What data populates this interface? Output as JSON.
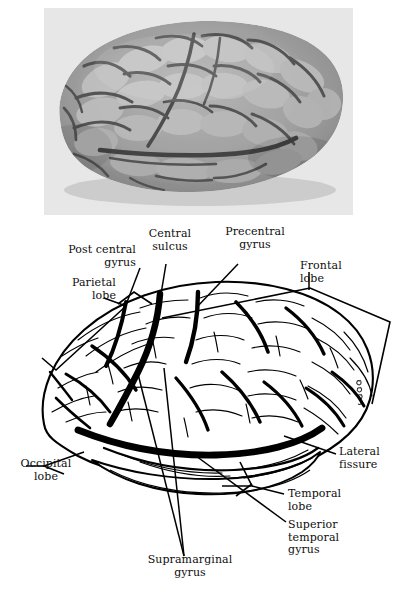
{
  "figure": {
    "kind": "anatomical-figure",
    "panels": [
      {
        "id": "photograph",
        "type": "grayscale-photograph",
        "caption": "",
        "description": "lateral view of a human cerebrum, occipital pole at left, frontal pole at right",
        "background_color": "#e9e9e9"
      },
      {
        "id": "line-drawing",
        "type": "labeled-line-drawing",
        "caption": "",
        "description": "ink line drawing of the same lateral brain view with leader lines to named structures",
        "background_color": "#ffffff",
        "ink_color": "#000000"
      }
    ]
  },
  "labels": [
    {
      "id": "post-central-gyrus",
      "text": "Post central\ngyrus",
      "align": "right",
      "left": 40,
      "top": 244,
      "width": 96,
      "leader": "diagonal-line"
    },
    {
      "id": "central-sulcus",
      "text": "Central\nsulcus",
      "align": "center",
      "left": 134,
      "top": 228,
      "width": 72,
      "leader": "diagonal-line"
    },
    {
      "id": "precentral-gyrus",
      "text": "Precentral\ngyrus",
      "align": "center",
      "left": 214,
      "top": 226,
      "width": 82,
      "leader": "diagonal-line"
    },
    {
      "id": "frontal-lobe",
      "text": "Frontal\nlobe",
      "align": "left",
      "left": 300,
      "top": 260,
      "width": 70,
      "leader": "angular-bracket"
    },
    {
      "id": "parietal-lobe",
      "text": "Parietal\nlobe",
      "align": "right",
      "left": 44,
      "top": 277,
      "width": 72,
      "leader": "angular-bracket"
    },
    {
      "id": "occipital-lobe",
      "text": "Occipital\nlobe",
      "align": "center",
      "left": 10,
      "top": 458,
      "width": 72,
      "leader": "angular-bracket"
    },
    {
      "id": "lateral-fissure",
      "text": "Lateral\nfissure",
      "align": "left",
      "left": 339,
      "top": 446,
      "width": 66,
      "leader": "diagonal-line"
    },
    {
      "id": "temporal-lobe",
      "text": "Temporal\nlobe",
      "align": "left",
      "left": 288,
      "top": 488,
      "width": 78,
      "leader": "angular-bracket"
    },
    {
      "id": "superior-temporal-gyrus",
      "text": "Superior\ntemporal\ngyrus",
      "align": "left",
      "left": 288,
      "top": 519,
      "width": 76,
      "leader": "diagonal-line"
    },
    {
      "id": "supramarginal-gyrus",
      "text": "Supramarginal\ngyrus",
      "align": "center",
      "left": 120,
      "top": 554,
      "width": 140,
      "leader": "double-line-v"
    }
  ],
  "artist_signature": {
    "present": true,
    "text": "",
    "description": "small illegible vertical signature near the right frontal margin of the drawing"
  }
}
